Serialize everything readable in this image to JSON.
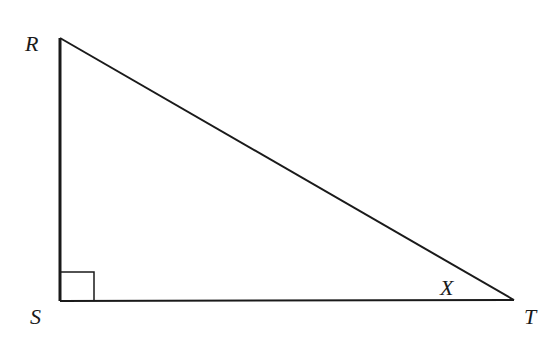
{
  "diagram": {
    "type": "right-triangle",
    "vertices": {
      "R": {
        "label": "R",
        "x": 60,
        "y": 38
      },
      "S": {
        "label": "S",
        "x": 60,
        "y": 301
      },
      "T": {
        "label": "T",
        "x": 514,
        "y": 300
      }
    },
    "right_angle_at": "S",
    "angle_label": {
      "label": "X",
      "at": "T"
    },
    "colors": {
      "stroke": "#1a1a1a",
      "background": "#ffffff"
    }
  }
}
